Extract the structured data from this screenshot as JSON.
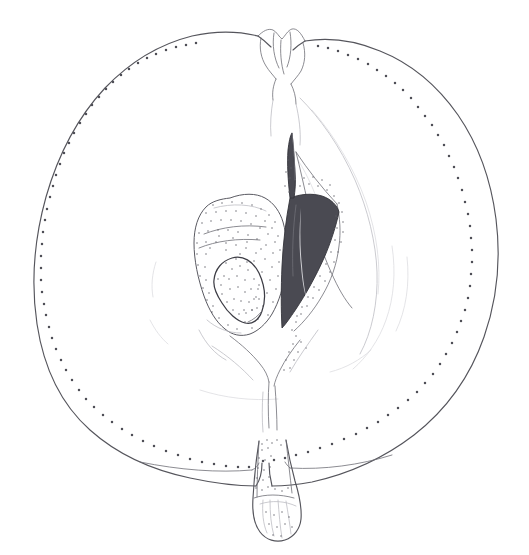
{
  "figure": {
    "kind": "botanical-illustration",
    "title": "",
    "caption": "",
    "background_color": "#ffffff",
    "ink_color": "#55555c",
    "faint_ink_color": "#b9b9c0",
    "seed_fill_color": "#4a4a52",
    "stipple_color": "#5d5d65",
    "canvas": {
      "width": 529,
      "height": 555
    }
  },
  "parts": [
    {
      "id": "fruit-outline",
      "label": "Fruit outline (pericarp contour)"
    },
    {
      "id": "skin-stipple",
      "label": "Skin stipple band"
    },
    {
      "id": "calyx",
      "label": "Calyx / sepal remnant"
    },
    {
      "id": "calyx-tube",
      "label": "Calyx tube"
    },
    {
      "id": "core-line",
      "label": "Core boundary"
    },
    {
      "id": "left-locule",
      "label": "Left seed locule"
    },
    {
      "id": "right-locule",
      "label": "Right seed locule"
    },
    {
      "id": "left-seed",
      "label": "Left seed"
    },
    {
      "id": "right-seed",
      "label": "Right seed"
    },
    {
      "id": "vascular-bundle",
      "label": "Central vascular bundle"
    },
    {
      "id": "stem",
      "label": "Stem / peduncle"
    },
    {
      "id": "stem-cavity",
      "label": "Stem cavity (basin)"
    },
    {
      "id": "flesh-lines",
      "label": "Flesh contour lines"
    }
  ],
  "chart_data": {
    "type": "scatter",
    "title": "",
    "xlabel": "",
    "ylabel": "",
    "grid": false,
    "legend": "none"
  }
}
